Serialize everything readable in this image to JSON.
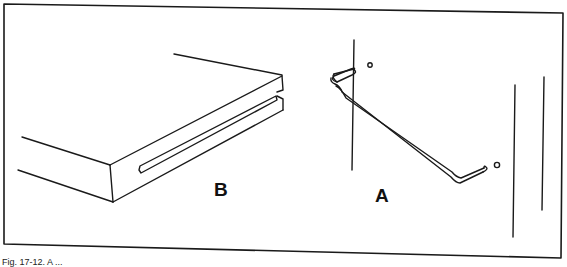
{
  "figure": {
    "labels": {
      "shelf": "B",
      "hook": "A"
    },
    "caption": "Fig. 17-12. A ...",
    "colors": {
      "line": "#1a1a1a",
      "background": "#ffffff"
    },
    "parts": [
      {
        "id": "B",
        "description": "slotted shelf board"
      },
      {
        "id": "A",
        "description": "wire hanger hook on pegboard"
      }
    ]
  }
}
